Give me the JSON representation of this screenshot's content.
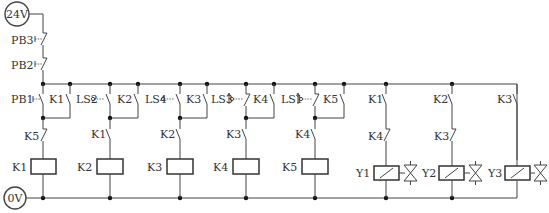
{
  "diagram": {
    "type": "electrical-ladder-diagram",
    "supply": {
      "positive": "24V",
      "negative": "0V"
    },
    "series_contacts": [
      {
        "label": "PB3",
        "kind": "pushbutton-nc"
      },
      {
        "label": "PB2",
        "kind": "pushbutton-nc"
      }
    ],
    "rungs": [
      {
        "start": "PB1",
        "start_kind": "pushbutton-no",
        "hold": "K1",
        "interlock": "K5",
        "interlock_kind": "nc",
        "coil": "K1"
      },
      {
        "start": "LS2",
        "start_kind": "limit-switch-no",
        "hold": "K2",
        "interlock": "K1",
        "interlock_kind": "no",
        "coil": "K2"
      },
      {
        "start": "LS4",
        "start_kind": "limit-switch-no",
        "hold": "K3",
        "interlock": "K2",
        "interlock_kind": "no",
        "coil": "K3"
      },
      {
        "start": "LS3",
        "start_kind": "limit-switch-nc",
        "hold": "K4",
        "interlock": "K3",
        "interlock_kind": "no",
        "coil": "K4"
      },
      {
        "start": "LS1",
        "start_kind": "limit-switch-nc",
        "hold": "K5",
        "interlock": "K4",
        "interlock_kind": "no",
        "coil": "K5"
      }
    ],
    "valve_rungs": [
      {
        "contact1": "K1",
        "contact1_kind": "no",
        "contact2": "K4",
        "contact2_kind": "nc",
        "solenoid": "Y1"
      },
      {
        "contact1": "K2",
        "contact1_kind": "no",
        "contact2": "K3",
        "contact2_kind": "nc",
        "solenoid": "Y2"
      },
      {
        "contact1": "K3",
        "contact1_kind": "no",
        "contact2": "",
        "contact2_kind": "",
        "solenoid": "Y3"
      }
    ]
  },
  "labels": {
    "v24": "24V",
    "v0": "0V",
    "pb3": "PB3",
    "pb2": "PB2",
    "pb1": "PB1",
    "r1_hold": "K1",
    "r1_int": "K5",
    "r1_coil": "K1",
    "r2_start": "LS2",
    "r2_hold": "K2",
    "r2_int": "K1",
    "r2_coil": "K2",
    "r3_start": "LS4",
    "r3_hold": "K3",
    "r3_int": "K2",
    "r3_coil": "K3",
    "r4_start": "LS3",
    "r4_hold": "K4",
    "r4_int": "K3",
    "r4_coil": "K4",
    "r5_start": "LS1",
    "r5_hold": "K5",
    "r5_int": "K4",
    "r5_coil": "K5",
    "y1_c1": "K1",
    "y1_c2": "K4",
    "y1_coil": "Y1",
    "y2_c1": "K2",
    "y2_c2": "K3",
    "y2_coil": "Y2",
    "y3_c1": "K3",
    "y3_coil": "Y3"
  }
}
